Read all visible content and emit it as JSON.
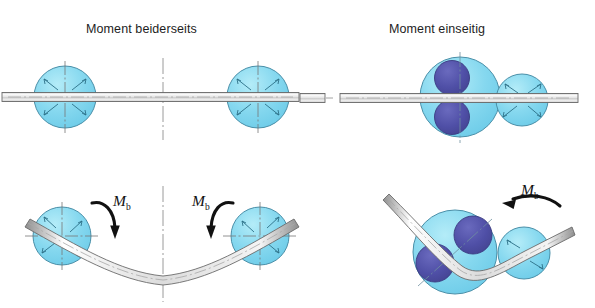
{
  "figure": {
    "kind": "technical-diagram",
    "background_color": "#ffffff",
    "width": 595,
    "height": 308
  },
  "colors": {
    "roller_light": "#7fd6ee",
    "roller_light_fill2": "#9fe2f4",
    "roller_outline": "#4a8fa8",
    "roller_dark": "#4f4fa6",
    "roller_dark_outline": "#3a3a80",
    "bar_body": "#d9d9d9",
    "bar_outline": "#6b6b6b",
    "centerline": "#8a8a8a",
    "arrow_black": "#111111",
    "text": "#1d1d1d"
  },
  "panels": [
    {
      "id": "left",
      "title": "Moment beiderseits",
      "rows": [
        {
          "id": "left-top",
          "description": "Straight bar held horizontally between two light-blue rollers with crosshair centre lines",
          "rollers": [
            {
              "name": "roller-left",
              "cx": 65,
              "cy": 97,
              "r": 31,
              "fill": "roller_light",
              "crosshair": true
            },
            {
              "name": "roller-right",
              "cx": 258,
              "cy": 97,
              "r": 31,
              "fill": "roller_light",
              "crosshair": true
            }
          ],
          "bar": {
            "name": "bar-straight",
            "x1": 2,
            "x2": 300,
            "y": 97,
            "thickness": 9,
            "dashed_centerline": true
          },
          "vertical_centerline": {
            "x": 163,
            "y1": 58,
            "y2": 140
          }
        },
        {
          "id": "left-bottom",
          "description": "Bar bent into a symmetric sagging curve; bending moment arrows applied at both ends",
          "rollers": [
            {
              "name": "roller-left",
              "cx": 62,
              "cy": 236,
              "r": 29,
              "fill": "roller_light",
              "crosshair": true,
              "crosshair_rotation_deg": 22
            },
            {
              "name": "roller-right",
              "cx": 260,
              "cy": 236,
              "r": 29,
              "fill": "roller_light",
              "crosshair": true,
              "crosshair_rotation_deg": -22
            }
          ],
          "bar": {
            "name": "bar-bent-sagging",
            "thickness": 9,
            "dashed_centerline": true
          },
          "vertical_centerline": {
            "x": 163,
            "y1": 186,
            "y2": 300
          },
          "moment_arrows": [
            {
              "name": "moment-arrow-left",
              "label": "M",
              "subscript": "b",
              "sense": "clockwise",
              "label_x": 113,
              "label_y": 193
            },
            {
              "name": "moment-arrow-right",
              "label": "M",
              "subscript": "b",
              "sense": "counterclockwise",
              "label_x": 192,
              "label_y": 193
            }
          ]
        }
      ]
    },
    {
      "id": "right",
      "title": "Moment einseitig",
      "rows": [
        {
          "id": "right-top",
          "description": "Straight bar between a large twin-roller assembly (two dark blue discs inside a light blue body) and a single small light-blue roller",
          "rollers": [
            {
              "name": "roller-assembly-large",
              "cx": 460,
              "cy": 97,
              "r": 40,
              "fill": "roller_light",
              "crosshair": true,
              "inner_discs": [
                {
                  "name": "inner-disc-upper",
                  "cx": 452,
                  "cy": 79,
                  "r": 17,
                  "fill": "roller_dark"
                },
                {
                  "name": "inner-disc-lower",
                  "cx": 452,
                  "cy": 116,
                  "r": 17,
                  "fill": "roller_dark"
                }
              ]
            },
            {
              "name": "roller-small",
              "cx": 522,
              "cy": 100,
              "r": 26,
              "fill": "roller_light",
              "crosshair": false
            }
          ],
          "bar": {
            "name": "bar-straight",
            "x1": 340,
            "x2": 578,
            "y": 98,
            "thickness": 9,
            "dashed_centerline": true
          },
          "bar_stub": {
            "name": "bar-stub-left",
            "x1": 300,
            "x2": 325,
            "y": 98
          }
        },
        {
          "id": "right-bottom",
          "description": "Bar bent once at the twin-roller assembly; single bending moment arrow applied on one side only",
          "rollers": [
            {
              "name": "roller-assembly-large",
              "cx": 455,
              "cy": 252,
              "r": 42,
              "fill": "roller_light",
              "crosshair": false,
              "inner_discs": [
                {
                  "name": "inner-disc-upper-right",
                  "cx": 472,
                  "cy": 236,
                  "r": 19,
                  "fill": "roller_dark"
                },
                {
                  "name": "inner-disc-lower-left",
                  "cx": 435,
                  "cy": 263,
                  "r": 19,
                  "fill": "roller_dark"
                }
              ]
            },
            {
              "name": "roller-small",
              "cx": 524,
              "cy": 253,
              "r": 26,
              "fill": "roller_light",
              "crosshair": false
            }
          ],
          "bar": {
            "name": "bar-bent-single",
            "thickness": 9,
            "dashed_centerline": true,
            "incoming_angle_deg": 48,
            "outgoing_angle_deg": -12
          },
          "moment_arrows": [
            {
              "name": "moment-arrow-single",
              "label": "M",
              "subscript": "b",
              "sense": "counterclockwise",
              "label_x": 521,
              "label_y": 182
            }
          ]
        }
      ]
    }
  ]
}
